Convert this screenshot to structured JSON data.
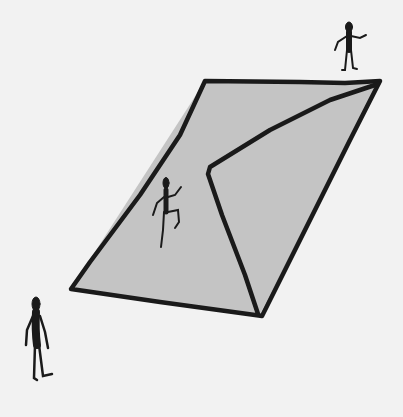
{
  "scene": {
    "description": "Hand-drawn sketch of a gray slanted ramp/wall with a fold and three stick figures",
    "background_color": "#f2f2f2",
    "ramp_fill_color": "#c4c4c4",
    "stroke_color": "#1a1a1a"
  },
  "figures": [
    {
      "name": "standing-figure-top",
      "pose": "standing on top edge, waving"
    },
    {
      "name": "climbing-figure",
      "pose": "climbing up the ramp"
    },
    {
      "name": "standing-figure-bottom",
      "pose": "standing on ground at bottom left"
    }
  ]
}
